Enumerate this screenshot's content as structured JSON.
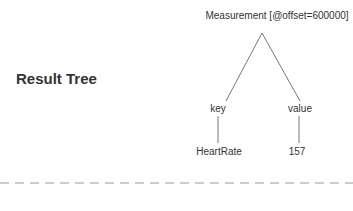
{
  "title": "Result Tree",
  "tree": {
    "root": "Measurement [@offset=600000]",
    "children": [
      {
        "label": "key",
        "child": "HeartRate"
      },
      {
        "label": "value",
        "child": "157"
      }
    ]
  },
  "colors": {
    "line": "#777777",
    "dash": "#999999",
    "text": "#333333"
  }
}
